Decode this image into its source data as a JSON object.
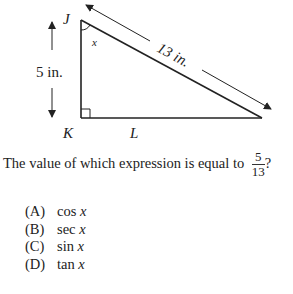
{
  "figure": {
    "vertices": {
      "J": "J",
      "K": "K",
      "L": "L"
    },
    "angle_label": "x",
    "side_JK_label": "5 in.",
    "hypotenuse_label": "13 in.",
    "right_angle_at": "K"
  },
  "question": {
    "text": "The value of which expression is equal to",
    "fraction": {
      "numerator": "5",
      "denominator": "13"
    },
    "end": "?"
  },
  "choices": [
    {
      "letter": "(A)",
      "func": "cos",
      "var": "x"
    },
    {
      "letter": "(B)",
      "func": "sec",
      "var": "x"
    },
    {
      "letter": "(C)",
      "func": "sin",
      "var": "x"
    },
    {
      "letter": "(D)",
      "func": "tan",
      "var": "x"
    }
  ]
}
